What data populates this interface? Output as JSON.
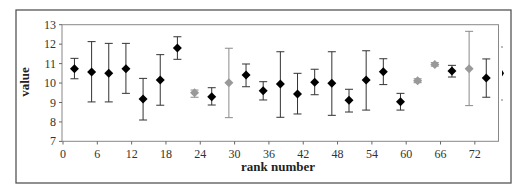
{
  "chart_data": {
    "type": "scatter",
    "title": "",
    "xlabel": "rank number",
    "ylabel": "value",
    "xlim": [
      0,
      76
    ],
    "ylim": [
      7,
      13
    ],
    "x_ticks": [
      0,
      6,
      12,
      18,
      24,
      30,
      36,
      42,
      48,
      54,
      60,
      66,
      72
    ],
    "y_ticks": [
      7,
      8,
      9,
      10,
      11,
      12,
      13
    ],
    "grid": false,
    "legend": "none",
    "series": [
      {
        "name": "black",
        "color": "#000000",
        "marker": "diamond",
        "points": [
          {
            "x": 2,
            "y": 10.74,
            "low": 10.22,
            "high": 11.27
          },
          {
            "x": 5,
            "y": 10.57,
            "low": 9.03,
            "high": 12.13
          },
          {
            "x": 8,
            "y": 10.5,
            "low": 9.03,
            "high": 12.04
          },
          {
            "x": 11,
            "y": 10.74,
            "low": 9.47,
            "high": 12.04
          },
          {
            "x": 14,
            "y": 9.18,
            "low": 8.1,
            "high": 10.24
          },
          {
            "x": 17,
            "y": 10.16,
            "low": 8.86,
            "high": 11.46
          },
          {
            "x": 20,
            "y": 11.8,
            "low": 11.22,
            "high": 12.38
          },
          {
            "x": 26,
            "y": 9.3,
            "low": 8.87,
            "high": 9.76
          },
          {
            "x": 32,
            "y": 10.41,
            "low": 9.81,
            "high": 10.98
          },
          {
            "x": 35,
            "y": 9.61,
            "low": 9.13,
            "high": 10.07
          },
          {
            "x": 38,
            "y": 9.95,
            "low": 8.24,
            "high": 11.61
          },
          {
            "x": 41,
            "y": 9.44,
            "low": 8.41,
            "high": 10.5
          },
          {
            "x": 44,
            "y": 10.04,
            "low": 9.4,
            "high": 10.71
          },
          {
            "x": 47,
            "y": 9.99,
            "low": 8.34,
            "high": 11.61
          },
          {
            "x": 50,
            "y": 9.11,
            "low": 8.51,
            "high": 9.68
          },
          {
            "x": 53,
            "y": 10.16,
            "low": 8.61,
            "high": 11.66
          },
          {
            "x": 56,
            "y": 10.58,
            "low": 9.92,
            "high": 11.25
          },
          {
            "x": 59,
            "y": 9.04,
            "low": 8.61,
            "high": 9.47
          },
          {
            "x": 68,
            "y": 10.62,
            "low": 10.31,
            "high": 10.91
          },
          {
            "x": 74,
            "y": 10.26,
            "low": 9.27,
            "high": 11.24
          }
        ]
      },
      {
        "name": "gray",
        "color": "#999999",
        "marker": "diamond",
        "points": [
          {
            "x": 23,
            "y": 9.5,
            "low": 9.27,
            "high": 9.64
          },
          {
            "x": 29,
            "y": 10.02,
            "low": 8.22,
            "high": 11.79
          },
          {
            "x": 62,
            "y": 10.12,
            "low": 10.02,
            "high": 10.22
          },
          {
            "x": 65,
            "y": 10.96,
            "low": 10.87,
            "high": 11.05
          },
          {
            "x": 71,
            "y": 10.74,
            "low": 8.84,
            "high": 12.66
          }
        ]
      }
    ]
  },
  "labels": {
    "x_axis_title": "rank number",
    "y_axis_title": "value"
  }
}
